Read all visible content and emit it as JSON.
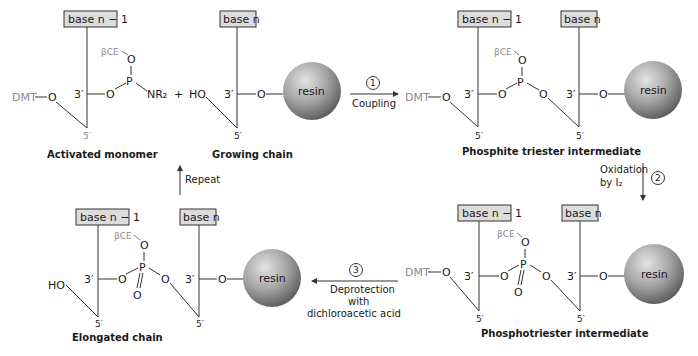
{
  "diagram": {
    "structures": {
      "activated_monomer": {
        "title": "Activated monomer",
        "base_label": "base n − 1",
        "protecting_group": "DMT",
        "phosphate_group": "βCE",
        "amine": "NR₂",
        "prime3": "3′",
        "prime5": "5′"
      },
      "growing_chain": {
        "title": "Growing chain",
        "base_label": "base n",
        "hydroxyl": "HO",
        "support": "resin",
        "prime3": "3′",
        "prime5": "5′"
      },
      "phosphite_triester": {
        "title": "Phosphite triester intermediate",
        "base1_label": "base n − 1",
        "base2_label": "base n",
        "protecting_group": "DMT",
        "phosphate_group": "βCE",
        "support": "resin"
      },
      "phosphotriester": {
        "title": "Phosphotriester intermediate",
        "base1_label": "base n − 1",
        "base2_label": "base n",
        "protecting_group": "DMT",
        "phosphate_group": "βCE",
        "support": "resin"
      },
      "elongated_chain": {
        "title": "Elongated chain",
        "base1_label": "base n − 1",
        "base2_label": "base n",
        "hydroxyl": "HO",
        "phosphate_group": "βCE",
        "support": "resin"
      }
    },
    "plus_sign": "+",
    "steps": [
      {
        "number": "1",
        "label": "Coupling"
      },
      {
        "number": "2",
        "label_line1": "Oxidation",
        "label_line2": "by I₂"
      },
      {
        "number": "3",
        "label_line1": "Deprotection",
        "label_line2": "with",
        "label_line3": "dichloroacetic acid"
      }
    ],
    "repeat_label": "Repeat",
    "atoms": {
      "O": "O",
      "P": "P"
    },
    "colors": {
      "box_fill": "#dcdcdc",
      "gray_text": "#8a8a8a",
      "resin_light": "#e0e0e0",
      "resin_dark": "#6a6a6a"
    }
  }
}
